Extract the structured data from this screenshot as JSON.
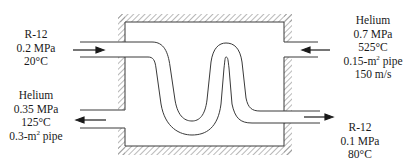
{
  "diagram": {
    "streams": {
      "r12_inlet": {
        "fluid": "R-12",
        "pressure": "0.2 MPa",
        "temperature": "20°C",
        "direction": "in"
      },
      "r12_outlet": {
        "fluid": "R-12",
        "pressure": "0.1 MPa",
        "temperature": "80°C",
        "direction": "out"
      },
      "helium_inlet": {
        "fluid": "Helium",
        "pressure": "0.7 MPa",
        "temperature": "525°C",
        "pipe_area_prefix": "0.15-m",
        "pipe_area_exp": "2",
        "pipe_area_suffix": " pipe",
        "velocity": "150 m/s",
        "direction": "in"
      },
      "helium_outlet": {
        "fluid": "Helium",
        "pressure": "0.35 MPa",
        "temperature": "125°C",
        "pipe_area_prefix": "0.3-m",
        "pipe_area_exp": "2",
        "pipe_area_suffix": " pipe",
        "direction": "out"
      }
    },
    "colors": {
      "line": "#3a3a3a",
      "hatch": "#777777",
      "background": "#ffffff"
    }
  }
}
